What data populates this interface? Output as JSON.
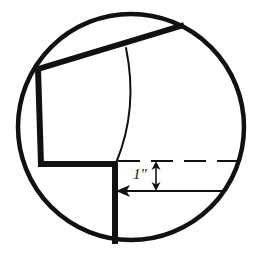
{
  "figure": {
    "background_color": "#ffffff",
    "stroke_color": "#111111",
    "canvas": {
      "width": 264,
      "height": 260
    }
  },
  "circle": {
    "name": "field-of-view-circle",
    "center_x": 131,
    "center_y": 127,
    "radius": 113,
    "stroke_width": 4.5
  },
  "shapes": {
    "diagonal_top_edge": {
      "label": "upper diagonal edge",
      "x1": 38,
      "y1": 69,
      "x2": 184,
      "y2": 25,
      "stroke_width": 6
    },
    "left_vertical_edge": {
      "label": "left vertical edge",
      "x1": 38,
      "y1": 69,
      "x2": 41,
      "y2": 164,
      "stroke_width": 6
    },
    "lower_horizontal_edge": {
      "label": "lower horizontal shoulder",
      "x1": 39,
      "y1": 164,
      "x2": 116,
      "y2": 164,
      "stroke_width": 6
    },
    "center_vertical_edge": {
      "label": "center vertical edge",
      "x1": 115,
      "y1": 163,
      "x2": 115,
      "y2": 244,
      "stroke_width": 6
    },
    "center_curve": {
      "label": "curved profile line",
      "path": "M 126 48 C 133 82, 134 120, 116 163",
      "stroke_width": 2
    }
  },
  "annotations": {
    "dimension_text": "1\"",
    "dimension_text_x": 133,
    "dimension_text_y": 167,
    "dashed_reference_line": {
      "label": "dashed reference line",
      "x1": 118,
      "y1": 161,
      "x2": 239,
      "y2": 161,
      "stroke_width": 2,
      "dash_pattern": "22 11"
    },
    "vertical_dimension_arrow": {
      "label": "vertical double-headed dimension arrow",
      "x": 156,
      "y_top": 162,
      "y_bottom": 190,
      "stroke_width": 1.6,
      "double_headed": true
    },
    "horizontal_leader_line": {
      "label": "horizontal leader with left arrowhead",
      "x1": 117,
      "y1": 191,
      "x2": 226,
      "y2": 191,
      "stroke_width": 1.6,
      "arrowhead": "left"
    }
  }
}
